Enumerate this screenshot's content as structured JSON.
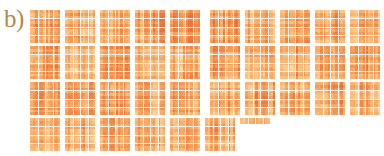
{
  "figure": {
    "panel_label": "b)",
    "label_color": "#b8874a",
    "background": "#ffffff"
  },
  "chart_data": {
    "type": "heatmap",
    "title": "",
    "subtitle": "",
    "xlabel": "",
    "ylabel": "",
    "legend": [],
    "grid": false,
    "annotations": [
      "b)"
    ],
    "colormap": {
      "name": "Oranges",
      "stops": [
        "#fdf0e0",
        "#fde4c8",
        "#fbc88c",
        "#f7ab66",
        "#f28c4e",
        "#e8703c"
      ],
      "vmin": 0,
      "vmax": 1
    },
    "tile_matrix_size": [
      12,
      12
    ],
    "tile_px": [
      30,
      33
    ],
    "tile_gap_px": 5,
    "row_gap_px": 3,
    "rows": [
      {
        "index": 1,
        "y": 0,
        "tile_count": 10,
        "wide_gap_after_index": 5,
        "tiles": [
          {
            "id": "r1c1",
            "width": 30,
            "mean": 0.55,
            "seed": 101
          },
          {
            "id": "r1c2",
            "width": 30,
            "mean": 0.52,
            "seed": 102
          },
          {
            "id": "r1c3",
            "width": 30,
            "mean": 0.5,
            "seed": 103
          },
          {
            "id": "r1c4",
            "width": 30,
            "mean": 0.57,
            "seed": 104
          },
          {
            "id": "r1c5",
            "width": 30,
            "mean": 0.6,
            "seed": 105
          },
          {
            "id": "r1c6",
            "width": 30,
            "mean": 0.58,
            "seed": 106
          },
          {
            "id": "r1c7",
            "width": 30,
            "mean": 0.49,
            "seed": 107
          },
          {
            "id": "r1c8",
            "width": 30,
            "mean": 0.53,
            "seed": 108
          },
          {
            "id": "r1c9",
            "width": 30,
            "mean": 0.56,
            "seed": 109
          },
          {
            "id": "r1c10",
            "width": 30,
            "mean": 0.51,
            "seed": 110
          }
        ]
      },
      {
        "index": 2,
        "y": 36,
        "tile_count": 10,
        "wide_gap_after_index": 5,
        "tiles": [
          {
            "id": "r2c1",
            "width": 30,
            "mean": 0.54,
            "seed": 201
          },
          {
            "id": "r2c2",
            "width": 30,
            "mean": 0.51,
            "seed": 202
          },
          {
            "id": "r2c3",
            "width": 30,
            "mean": 0.56,
            "seed": 203
          },
          {
            "id": "r2c4",
            "width": 30,
            "mean": 0.5,
            "seed": 204
          },
          {
            "id": "r2c5",
            "width": 30,
            "mean": 0.53,
            "seed": 205
          },
          {
            "id": "r2c6",
            "width": 30,
            "mean": 0.57,
            "seed": 206
          },
          {
            "id": "r2c7",
            "width": 30,
            "mean": 0.52,
            "seed": 207
          },
          {
            "id": "r2c8",
            "width": 30,
            "mean": 0.55,
            "seed": 208
          },
          {
            "id": "r2c9",
            "width": 30,
            "mean": 0.49,
            "seed": 209
          },
          {
            "id": "r2c10",
            "width": 30,
            "mean": 0.58,
            "seed": 210
          }
        ]
      },
      {
        "index": 3,
        "y": 72,
        "tile_count": 10,
        "wide_gap_after_index": 5,
        "tiles": [
          {
            "id": "r3c1",
            "width": 30,
            "mean": 0.52,
            "seed": 301
          },
          {
            "id": "r3c2",
            "width": 30,
            "mean": 0.55,
            "seed": 302
          },
          {
            "id": "r3c3",
            "width": 30,
            "mean": 0.58,
            "seed": 303
          },
          {
            "id": "r3c4",
            "width": 30,
            "mean": 0.51,
            "seed": 304
          },
          {
            "id": "r3c5",
            "width": 30,
            "mean": 0.54,
            "seed": 305
          },
          {
            "id": "r3c6",
            "width": 30,
            "mean": 0.5,
            "seed": 306
          },
          {
            "id": "r3c7",
            "width": 30,
            "mean": 0.57,
            "seed": 307
          },
          {
            "id": "r3c8",
            "width": 30,
            "mean": 0.53,
            "seed": 308
          },
          {
            "id": "r3c9",
            "width": 30,
            "mean": 0.56,
            "seed": 309
          },
          {
            "id": "r3c10",
            "width": 30,
            "mean": 0.52,
            "seed": 310
          }
        ]
      },
      {
        "index": 4,
        "y": 108,
        "tile_count": 7,
        "wide_gap_after_index": 0,
        "tiles": [
          {
            "id": "r4c1",
            "width": 30,
            "mean": 0.54,
            "seed": 401
          },
          {
            "id": "r4c2",
            "width": 30,
            "mean": 0.52,
            "seed": 402
          },
          {
            "id": "r4c3",
            "width": 30,
            "mean": 0.56,
            "seed": 403
          },
          {
            "id": "r4c4",
            "width": 30,
            "mean": 0.51,
            "seed": 404
          },
          {
            "id": "r4c5",
            "width": 30,
            "mean": 0.55,
            "seed": 405
          },
          {
            "id": "r4c6",
            "width": 30,
            "mean": 0.53,
            "seed": 406
          },
          {
            "id": "r4c7",
            "width": 30,
            "mean": 0.5,
            "seed": 407,
            "partial": true,
            "visible_rows": 2
          }
        ]
      }
    ]
  }
}
